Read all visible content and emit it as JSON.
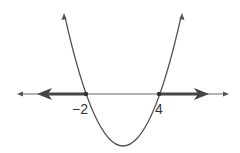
{
  "diagram": {
    "x_intercepts": [
      "−2",
      "4"
    ],
    "labels": {
      "left_root": "−2",
      "right_root": "4"
    },
    "solution": "x ≤ −2 or x ≥ 4",
    "colors": {
      "line": "#444444",
      "curve": "#555555"
    }
  }
}
